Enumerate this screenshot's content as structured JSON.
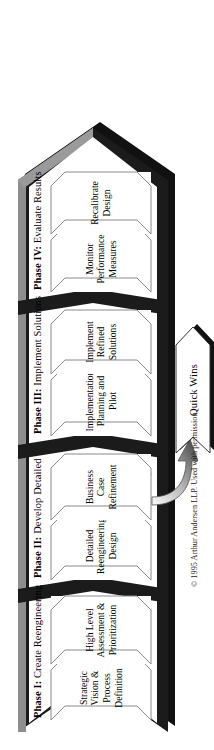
{
  "diagram": {
    "phases": [
      {
        "id": "phase-1",
        "label": "Phase I:",
        "name": "Create Reengineering",
        "sub": "Strategy",
        "steps": [
          {
            "id": "step-strategic-vision",
            "text": "Strategic\nVision &\nProcess\nDefinition"
          },
          {
            "id": "step-high-level-assessment",
            "text": "High Level\nAssessment &\nPrioritization"
          }
        ]
      },
      {
        "id": "phase-2",
        "label": "Phase II:",
        "name": "Develop Detailed",
        "sub": "Design",
        "steps": [
          {
            "id": "step-detailed-reengineering-design",
            "text": "Detailed\nReengineering\nDesign"
          },
          {
            "id": "step-business-case-refinement",
            "text": "Business\nCase\nRefinement"
          }
        ]
      },
      {
        "id": "phase-3",
        "label": "Phase III:",
        "name": "Implement Solutions",
        "sub": "",
        "steps": [
          {
            "id": "step-implementation-planning-pilot",
            "text": "Implementation\nPlanning and\nPilot"
          },
          {
            "id": "step-implement-refined-solutions",
            "text": "Implement\nRefined\nSolutions"
          }
        ]
      },
      {
        "id": "phase-4",
        "label": "Phase IV:",
        "name": "Evaluate Results",
        "sub": "",
        "steps": [
          {
            "id": "step-monitor-performance-measures",
            "text": "Monitor\nPerformance\nMeasures"
          },
          {
            "id": "step-recalibrate-design",
            "text": "Recalibrate\nDesign"
          }
        ]
      }
    ],
    "quick_wins": {
      "label": "Quick Wins"
    },
    "copyright": "© 1995 Arthur Andersen LLP.  Used with permission.",
    "colors": {
      "body_dark": "#1b1b1b",
      "bevel_grey": "#8e8e8e",
      "field_white": "#ffffff",
      "outline": "#7a7a7a",
      "text": "#000000"
    }
  }
}
